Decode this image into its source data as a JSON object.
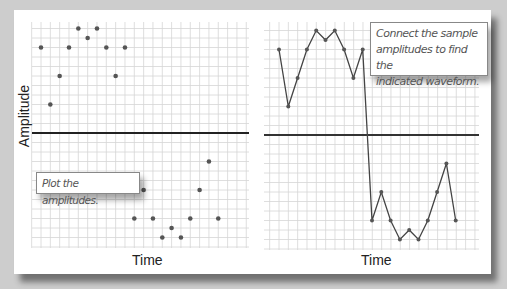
{
  "figure": {
    "left_panel": {
      "y_axis_label": "Amplitude",
      "x_axis_label": "Time",
      "callout": "Plot the amplitudes."
    },
    "right_panel": {
      "x_axis_label": "Time",
      "callout_lines": [
        "Connect the sample",
        "amplitudes to find the",
        "indicated waveform."
      ]
    },
    "colors": {
      "background": "#cdcdcd",
      "panel": "#ffffff",
      "grid": "#d6d6d6",
      "axis": "#222222",
      "points": "#555555",
      "waveform": "#444444"
    }
  },
  "chart_data": [
    {
      "type": "scatter",
      "title": "",
      "xlabel": "Time",
      "ylabel": "Amplitude",
      "x": [
        1,
        2,
        3,
        4,
        5,
        6,
        7,
        8,
        9,
        10,
        11,
        12,
        13,
        14,
        15,
        16,
        17,
        18,
        19,
        20
      ],
      "values": [
        9,
        3,
        6,
        9,
        11,
        10,
        11,
        9,
        6,
        9,
        -9,
        -6,
        -9,
        -11,
        -10,
        -11,
        -9,
        -6,
        -3,
        -9
      ],
      "ylim": [
        -12,
        12
      ],
      "grid": true,
      "annotations": [
        "Plot the amplitudes."
      ]
    },
    {
      "type": "line",
      "title": "",
      "xlabel": "Time",
      "ylabel": "Amplitude",
      "x": [
        1,
        2,
        3,
        4,
        5,
        6,
        7,
        8,
        9,
        10,
        11,
        12,
        13,
        14,
        15,
        16,
        17,
        18,
        19,
        20
      ],
      "values": [
        9,
        3,
        6,
        9,
        11,
        10,
        11,
        9,
        6,
        9,
        -9,
        -6,
        -9,
        -11,
        -10,
        -11,
        -9,
        -6,
        -3,
        -9
      ],
      "ylim": [
        -12,
        12
      ],
      "grid": true,
      "annotations": [
        "Connect the sample amplitudes to find the indicated waveform."
      ]
    }
  ]
}
